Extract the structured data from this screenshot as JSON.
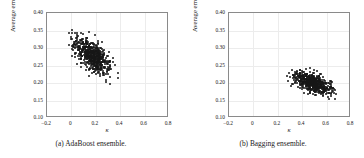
{
  "figure": {
    "background_color": "#ffffff",
    "marker_color": "#171717",
    "axis_color": "#8a8a8a",
    "grid_color": "#ececec"
  },
  "chart_data": [
    {
      "type": "scatter",
      "panel": "a",
      "title": "",
      "caption": "(a) AdaBoost ensemble.",
      "xlabel": "κ",
      "ylabel": "Average error",
      "xlim": [
        -0.2,
        0.8
      ],
      "ylim": [
        0.1,
        0.4
      ],
      "xticks": [
        -0.2,
        0,
        0.2,
        0.4,
        0.6,
        0.8
      ],
      "xticklabels": [
        "−0.2",
        "0",
        "0.2",
        "0.4",
        "0.6",
        "0.8"
      ],
      "yticks": [
        0.1,
        0.15,
        0.2,
        0.25,
        0.3,
        0.35,
        0.4
      ],
      "yticklabels": [
        "0.10",
        "0.15",
        "0.20",
        "0.25",
        "0.30",
        "0.35",
        "0.40"
      ],
      "grid": true,
      "legend": null,
      "n_points": 620,
      "cluster": {
        "x_mean": 0.17,
        "y_mean": 0.278,
        "x_std": 0.075,
        "y_std": 0.027,
        "correlation": -0.62,
        "x_range": [
          -0.1,
          0.52
        ],
        "y_range": [
          0.19,
          0.352
        ]
      }
    },
    {
      "type": "scatter",
      "panel": "b",
      "title": "",
      "caption": "(b) Bagging ensemble.",
      "xlabel": "κ",
      "ylabel": "Average error",
      "xlim": [
        -0.2,
        0.8
      ],
      "ylim": [
        0.1,
        0.4
      ],
      "xticks": [
        -0.2,
        0,
        0.2,
        0.4,
        0.6,
        0.8
      ],
      "xticklabels": [
        "−0.2",
        "0",
        "0.2",
        "0.4",
        "0.6",
        "0.8"
      ],
      "yticks": [
        0.1,
        0.15,
        0.2,
        0.25,
        0.3,
        0.35,
        0.4
      ],
      "yticklabels": [
        "0.10",
        "0.15",
        "0.20",
        "0.25",
        "0.30",
        "0.35",
        "0.40"
      ],
      "grid": true,
      "legend": null,
      "n_points": 620,
      "cluster": {
        "x_mean": 0.495,
        "y_mean": 0.199,
        "x_std": 0.072,
        "y_std": 0.015,
        "correlation": -0.55,
        "x_range": [
          0.205,
          0.725
        ],
        "y_range": [
          0.15,
          0.247
        ]
      }
    }
  ]
}
